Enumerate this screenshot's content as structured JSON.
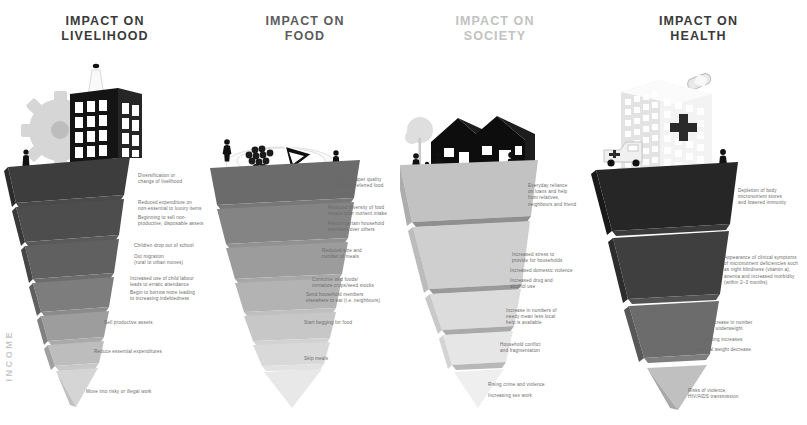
{
  "background_color": "#ffffff",
  "income_axis_label": "INCOME",
  "columns": [
    {
      "id": "livelihood",
      "title_line1": "IMPACT ON",
      "title_line2": "LIVELIHOOD",
      "title_color": "#3a3a3a",
      "scene_icons": [
        "factory-building-icon",
        "smokestack-icon",
        "gear-icon",
        "person-icon"
      ],
      "layers": [
        {
          "color": "#3d3d3d",
          "label": "Diversification or\nchange of livelihood"
        },
        {
          "color": "#4b4b4b",
          "label": "Reduced expenditure on\nnon-essential to luxury items"
        },
        {
          "color": "#5a5a5a",
          "label": "Beginning to sell non-\nproductive, disposable assets"
        },
        {
          "color": "#6e6e6e",
          "label": "Children drop out of school"
        },
        {
          "color": "#7c7c7c",
          "label": "Out migration\n(rural to urban moves)"
        },
        {
          "color": "#8f8f8f",
          "label": "Increased use of child labour\nleads to erratic attendance"
        },
        {
          "color": "#a2a2a2",
          "label": "Begin to borrow more leading\nto increasing indebtedness"
        },
        {
          "color": "#b4b4b4",
          "label": "Sell productive assets"
        },
        {
          "color": "#c6c6c6",
          "label": "Reduce essential expenditures"
        },
        {
          "color": "#d8d8d8",
          "label": "Move into risky or illegal work"
        }
      ]
    },
    {
      "id": "food",
      "title_line1": "IMPACT ON",
      "title_line2": "FOOD",
      "title_color": "#5c5c5c",
      "scene_icons": [
        "plate-icon",
        "grapes-icon",
        "pie-slice-icon",
        "person-icon",
        "person-icon"
      ],
      "layers": [
        {
          "color": "#6b6b6b",
          "label": "Eating cheaper quality\nand less preferred food"
        },
        {
          "color": "#797979",
          "label": "Reduced diversity of food\nmeans poor nutrient intake"
        },
        {
          "color": "#898989",
          "label": "Favour certain household\nmembers over others"
        },
        {
          "color": "#9a9a9a",
          "label": "Reduced size and\nnumber of meals"
        },
        {
          "color": "#adadad",
          "label": "Consume wild foods/\nimmature crops/seed stocks"
        },
        {
          "color": "#bcbcbc",
          "label": "Send household members\nelsewhere to eat (i.e. neighbours)"
        },
        {
          "color": "#cacaca",
          "label": "Start begging for food"
        },
        {
          "color": "#dcdcdc",
          "label": "Skip meals"
        }
      ]
    },
    {
      "id": "society",
      "title_line1": "IMPACT ON",
      "title_line2": "SOCIETY",
      "title_color": "#c2c2c2",
      "scene_icons": [
        "house-icon",
        "house-icon",
        "tree-icon",
        "family-icon",
        "person-icon"
      ],
      "layers": [
        {
          "color": "#bdbdbd",
          "label": "Everyday reliance\non loans and help\nfrom relatives,\nneighbours and friend"
        },
        {
          "color": "#c8c8c8",
          "label": "Increased stress to\nprovide for households"
        },
        {
          "color": "#d0d0d0",
          "label": "Increased domestic violence"
        },
        {
          "color": "#d6d6d6",
          "label": "Increased drug and\nalcohol use"
        },
        {
          "color": "#dedede",
          "label": "Increase in numbers of\nneedy mean less local\nhelp is available"
        },
        {
          "color": "#e4e4e4",
          "label": "Household conflict\nand fragmentation"
        },
        {
          "color": "#ececec",
          "label": "Rising crime and violence"
        },
        {
          "color": "#f1f1f1",
          "label": "Increasing sex work"
        }
      ]
    },
    {
      "id": "health",
      "title_line1": "IMPACT ON",
      "title_line2": "HEALTH",
      "title_color": "#3a3a3a",
      "scene_icons": [
        "hospital-building-icon",
        "medical-cross-icon",
        "ambulance-icon",
        "pill-capsule-icon",
        "person-icon"
      ],
      "layers": [
        {
          "color": "#2f2f2f",
          "label": "Depletion of body\nmicronutrient stores\nand lowered immunity"
        },
        {
          "color": "#4a4a4a",
          "label": "Appearance of clinical symptoms\nof micronutrient deficiencies such\nas night blindness (vitamin a),\nanemia and increased morbidity\n(within 2–3 months)"
        },
        {
          "color": "#6f6f6f",
          "label": "Increase in number\nof underweight"
        },
        {
          "color": "#8a8a8a",
          "label": "Wasting increases"
        },
        {
          "color": "#9d9d9d",
          "label": "Maternal weight decrease"
        },
        {
          "color": "#c4c4c4",
          "label": "Risks of violence,\nHIV/AIDS transmission"
        }
      ]
    }
  ]
}
